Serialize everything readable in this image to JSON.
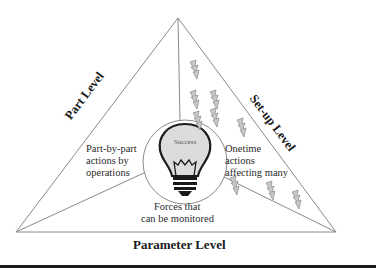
{
  "diagram": {
    "center": {
      "label": "Success",
      "icon": "lightbulb-icon"
    },
    "levels": {
      "left": "Part Level",
      "right": "Set-up Level",
      "bottom": "Parameter Level"
    },
    "regions": {
      "left": [
        "Part-by-part",
        "actions by",
        "operations"
      ],
      "right": [
        "Onetime",
        "actions",
        "affecting many"
      ],
      "bottom": [
        "Forces that",
        "can be monitored"
      ]
    },
    "decorations": {
      "icon": "lightning-bolt-icon",
      "count": 9
    },
    "colors": {
      "line": "#8a8a8a",
      "bulb_fill": "#dcdcdc",
      "bolt_fill": "#c8c8c8",
      "text": "#2b2b2b"
    }
  }
}
